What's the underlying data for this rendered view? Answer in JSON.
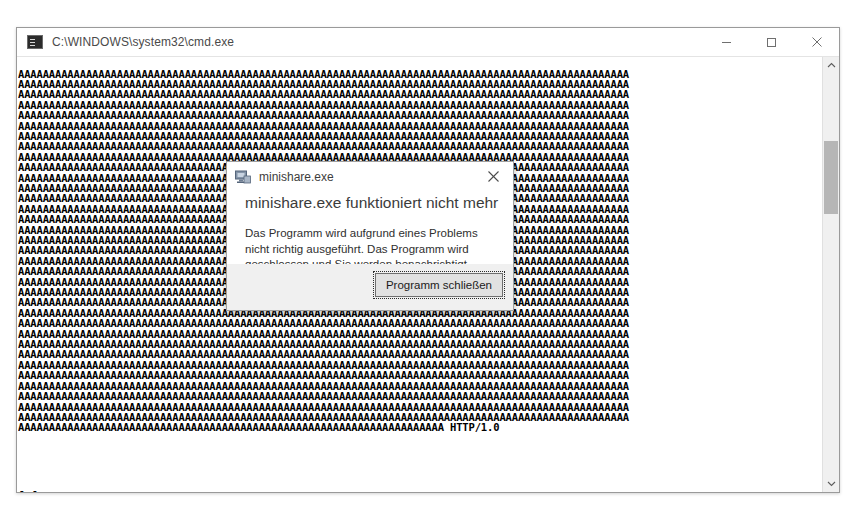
{
  "console_window": {
    "title": "C:\\WINDOWS\\system32\\cmd.exe",
    "icon": "cmd-console-icon",
    "controls": {
      "minimize": "minimize-icon",
      "maximize": "maximize-icon",
      "close": "close-icon"
    },
    "buffer": {
      "fill_char": "A",
      "cols": 99,
      "rows": 35,
      "last_line_a_count": 69,
      "trailing_text": " HTTP/1.0"
    },
    "output_lines": [
      "[*]Connect to server...",
      "[*]Send buffer...",
      "[*]Buffer sent"
    ],
    "prompt": "E:\\>",
    "scrollbar": {
      "up_arrow": "chevron-up-icon",
      "down_arrow": "chevron-down-icon",
      "thumb_position_percent": 20
    }
  },
  "error_dialog": {
    "title": "minishare.exe",
    "icon": "application-icon",
    "close_label": "close-icon",
    "heading": "minishare.exe funktioniert nicht mehr",
    "message": "Das Programm wird aufgrund eines Problems nicht richtig ausgeführt. Das Programm wird geschlossen und Sie werden benachrichtigt, wenn eine Lösung verfügbar ist.",
    "primary_button": "Programm schließen"
  },
  "colors": {
    "window_background": "#ffffff",
    "console_text": "#000000",
    "title_text": "#4a4a4a",
    "dialog_footer": "#f0f0f0",
    "button_face": "#e1e1e1",
    "scrollbar_thumb": "#b6b6b6"
  }
}
